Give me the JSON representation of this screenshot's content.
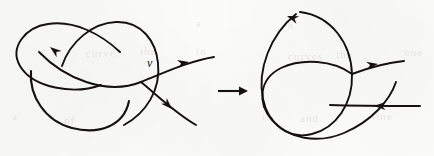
{
  "figure": {
    "kind": "knot-diagram-smoothing",
    "background_color": "#fbfbfa",
    "ink_color": "#14110f",
    "width": 434,
    "height": 156,
    "panels": [
      {
        "id": "before",
        "role": "left-diagram",
        "description": "Trefoil-like curve with a marked crossing",
        "crossing_label": "v",
        "loops": 3,
        "visible_arrowheads": 3
      },
      {
        "id": "after",
        "role": "right-diagram",
        "description": "Curve after the crossing v has been smoothed",
        "crossing_label": "",
        "loops": 2,
        "visible_arrowheads": 3
      }
    ],
    "transition": {
      "name": "transition-arrow",
      "direction": "right",
      "glyph": "→"
    },
    "bleed_through": [
      {
        "text": "curve",
        "x": 86,
        "y": 47,
        "size": 11,
        "rotate": -1
      },
      {
        "text": "the",
        "x": 140,
        "y": 45,
        "size": 11,
        "rotate": -1
      },
      {
        "text": "in",
        "x": 196,
        "y": 45,
        "size": 11,
        "rotate": 0
      },
      {
        "text": "curves",
        "x": 288,
        "y": 50,
        "size": 11,
        "rotate": -1
      },
      {
        "text": "the",
        "x": 336,
        "y": 48,
        "size": 11,
        "rotate": -1
      },
      {
        "text": "one",
        "x": 404,
        "y": 46,
        "size": 11,
        "rotate": 0
      },
      {
        "text": "a",
        "x": 12,
        "y": 110,
        "size": 11,
        "rotate": 0
      },
      {
        "text": "of",
        "x": 64,
        "y": 114,
        "size": 11,
        "rotate": 0
      },
      {
        "text": "is",
        "x": 262,
        "y": 110,
        "size": 11,
        "rotate": 0
      },
      {
        "text": "and",
        "x": 300,
        "y": 112,
        "size": 11,
        "rotate": 0
      },
      {
        "text": "line",
        "x": 372,
        "y": 110,
        "size": 11,
        "rotate": 0
      },
      {
        "text": "a",
        "x": 196,
        "y": 18,
        "size": 10,
        "rotate": 0
      },
      {
        "text": "h",
        "x": 288,
        "y": 20,
        "size": 10,
        "rotate": 0
      }
    ]
  },
  "left_diagram": {
    "name": "left-knot-diagram",
    "crossing_label": "v",
    "strokes": {
      "left_loop": "M 101 85 C 74 95, 33 88, 20 66 C 9 47, 26 27, 48 24 C 74 20, 101 34, 120 52",
      "right_loop": "M 62 66 C 70 42, 92 23, 116 22 C 142 21, 156 42, 158 63 C 161 90, 146 113, 124 125",
      "lower_loop": "M 31 71 C 29 96, 45 121, 72 128 C 99 135, 124 126, 129 101",
      "through_strand": "M 39 52 C 64 78, 106 96, 141 82 C 168 71, 190 61, 214 57",
      "tail_strand": "M 141 82 C 158 96, 174 112, 196 125"
    },
    "arrowheads": [
      {
        "name": "arrowhead-left-loop",
        "x": 50,
        "y": 47,
        "angle": 218
      },
      {
        "name": "arrowhead-upper-right",
        "x": 189,
        "y": 62,
        "angle": 350
      },
      {
        "name": "arrowhead-lower-right",
        "x": 172,
        "y": 109,
        "angle": 45
      }
    ]
  },
  "right_diagram": {
    "name": "right-knot-diagram",
    "strokes": {
      "vertical_loop": "M 300 12 C 332 16, 351 44, 352 74 C 353 104, 336 128, 312 134 C 289 140, 268 124, 263 99 C 257 70, 270 35, 296 14",
      "tilted_ellipse": "M 352 74 C 333 60, 302 58, 281 68 C 259 79, 257 103, 272 120 C 288 139, 318 144, 344 133 C 372 121, 390 100, 396 82",
      "upper_exit": "M 352 74 C 368 68, 384 63, 404 61",
      "lower_exit": "M 330 105 C 356 106, 386 106, 420 106"
    },
    "arrowheads": [
      {
        "name": "arrowhead-top-loop",
        "x": 287,
        "y": 16,
        "angle": 200
      },
      {
        "name": "arrowhead-upper-right",
        "x": 378,
        "y": 64,
        "angle": 352
      },
      {
        "name": "arrowhead-lower-right",
        "x": 374,
        "y": 106,
        "angle": 180
      }
    ]
  },
  "transition_arrow": {
    "name": "transition-arrow",
    "x1": 218,
    "x2": 248,
    "y": 91
  }
}
